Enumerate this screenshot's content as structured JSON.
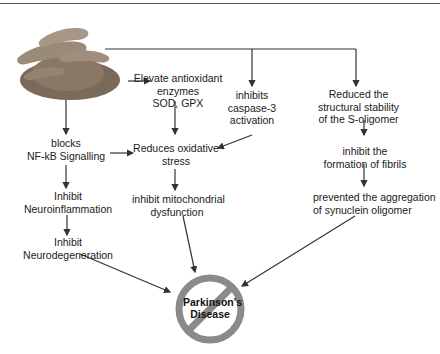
{
  "diagram": {
    "source_image": "turmeric-curcumin-powder",
    "nodes": {
      "antioxidant": [
        "Elevate antioxidant",
        "enzymes",
        "SOD, GPX"
      ],
      "caspase": [
        "inhibits",
        "caspase-3",
        "activation"
      ],
      "structural": [
        "Reduced the",
        "structural stability",
        "of the S-oligomer"
      ],
      "nfkb": [
        "blocks",
        "NF-kB Signalling"
      ],
      "oxidative": [
        "Reduces oxidative",
        "stress"
      ],
      "fibrils": [
        "inhibit the",
        "formation of fibrils"
      ],
      "neuroinflammation": [
        "Inhibit",
        "Neuroinflammation"
      ],
      "mitochondrial": [
        "inhibit mitochondrial",
        "dysfunction"
      ],
      "aggregation": [
        "prevented the aggregation",
        "of synuclein oligomer"
      ],
      "neurodegeneration": [
        "Inhibit",
        "Neurodegeneration"
      ]
    },
    "outcome": {
      "label_line1": "Parkinson's",
      "label_line2": "Disease",
      "symbol": "prohibition-sign"
    },
    "colors": {
      "line": "#333333",
      "prohibition": "#8a8a8a",
      "text": "#1a1a1a"
    }
  }
}
